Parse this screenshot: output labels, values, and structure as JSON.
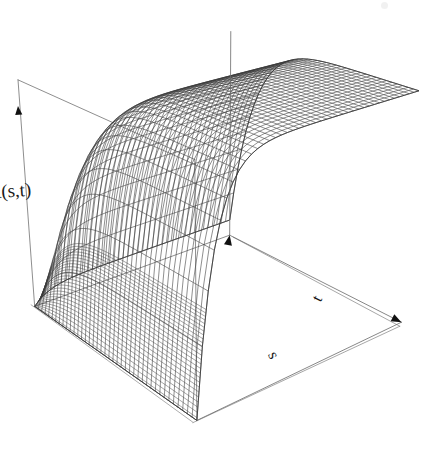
{
  "figure": {
    "kind": "3d-perspective-wireframe-surface",
    "background_color": "#ffffff",
    "line_color": "#3a3a3a",
    "box_color": "#6b6b6b",
    "label_color": "#1a1a1a",
    "width": 433,
    "height": 456
  },
  "labels": {
    "z_axis": "R(s,t)",
    "x_axis": "s",
    "y_axis": "t"
  },
  "chart_data": {
    "type": "surface",
    "title": "",
    "xlabel": "s",
    "ylabel": "t",
    "zlabel": "R(s,t)",
    "grid": false,
    "legend": false,
    "axis_ticks": false,
    "axis_arrows": true,
    "xlim": [
      0,
      1
    ],
    "ylim": [
      0,
      1
    ],
    "zlim": [
      0,
      1
    ],
    "x": [
      0,
      0.025,
      0.05,
      0.075,
      0.1,
      0.125,
      0.15,
      0.175,
      0.2,
      0.225,
      0.25,
      0.275,
      0.3,
      0.325,
      0.35,
      0.375,
      0.4,
      0.425,
      0.45,
      0.475,
      0.5,
      0.525,
      0.55,
      0.575,
      0.6,
      0.625,
      0.65,
      0.675,
      0.7,
      0.725,
      0.75,
      0.775,
      0.8,
      0.825,
      0.85,
      0.875,
      0.9,
      0.925,
      0.95,
      0.975,
      1
    ],
    "y": [
      0,
      0.025,
      0.05,
      0.075,
      0.1,
      0.125,
      0.15,
      0.175,
      0.2,
      0.225,
      0.25,
      0.275,
      0.3,
      0.325,
      0.35,
      0.375,
      0.4,
      0.425,
      0.45,
      0.475,
      0.5,
      0.525,
      0.55,
      0.575,
      0.6,
      0.625,
      0.65,
      0.675,
      0.7,
      0.725,
      0.75,
      0.775,
      0.8,
      0.825,
      0.85,
      0.875,
      0.9,
      0.925,
      0.95,
      0.975,
      1
    ],
    "z_formula": "R(s,t) = (1 - exp(-14*s)) * (1 - 0.92*t^7)",
    "z_description": "High plateau over most of the domain; sharp near-vertical drop to zero at the s = 0 edge; gentle roll-off toward the far t edge at large t.",
    "z_corner_values": {
      "s0_t0": 0.0,
      "s0_t1": 0.0,
      "s1_t0": 1.0,
      "s1_t1": 0.08
    },
    "mesh_nx": 41,
    "mesh_ny": 41,
    "view": {
      "theta_deg": -40,
      "phi_deg": 24,
      "perspective_d": 2.6,
      "scale": 1.0
    }
  },
  "view_box": {
    "name": "axis-bounding-box",
    "visible_edges": [
      "left-vertical",
      "front-left-base",
      "front-right-base",
      "back-base-partial",
      "right-vertical"
    ]
  }
}
